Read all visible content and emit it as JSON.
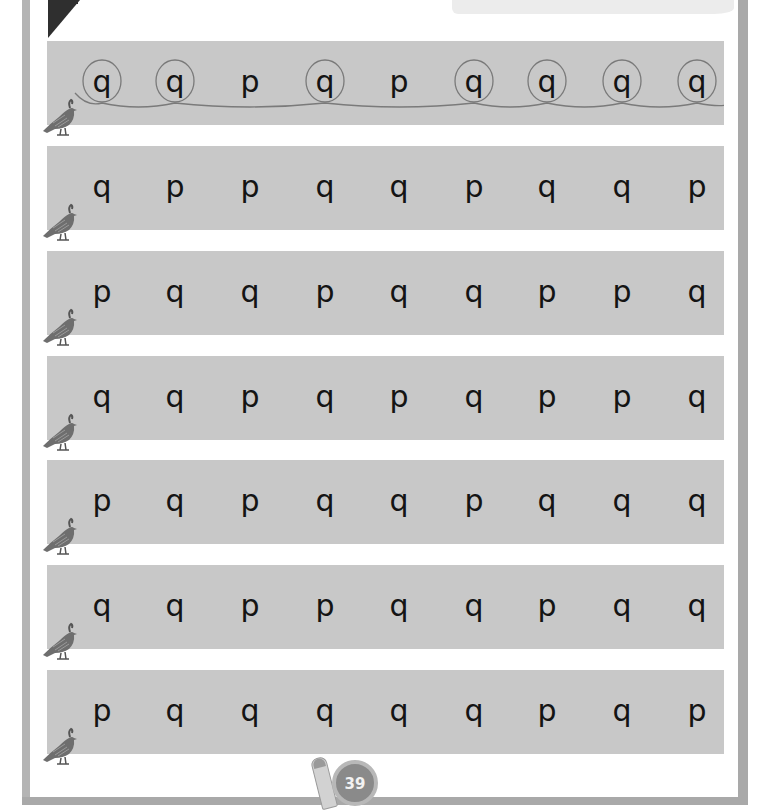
{
  "worksheet": {
    "instruction_example_row": 0,
    "letters_pair": [
      "p",
      "q"
    ],
    "target_letter": "q",
    "rows": [
      {
        "letters": [
          "q",
          "q",
          "p",
          "q",
          "p",
          "q",
          "q",
          "q",
          "q"
        ],
        "circled": [
          true,
          true,
          false,
          true,
          false,
          true,
          true,
          true,
          true
        ]
      },
      {
        "letters": [
          "q",
          "p",
          "p",
          "q",
          "q",
          "p",
          "q",
          "q",
          "p"
        ],
        "circled": [
          false,
          false,
          false,
          false,
          false,
          false,
          false,
          false,
          false
        ]
      },
      {
        "letters": [
          "p",
          "q",
          "q",
          "p",
          "q",
          "q",
          "p",
          "p",
          "q"
        ],
        "circled": [
          false,
          false,
          false,
          false,
          false,
          false,
          false,
          false,
          false
        ]
      },
      {
        "letters": [
          "q",
          "q",
          "p",
          "q",
          "p",
          "q",
          "p",
          "p",
          "q"
        ],
        "circled": [
          false,
          false,
          false,
          false,
          false,
          false,
          false,
          false,
          false
        ]
      },
      {
        "letters": [
          "p",
          "q",
          "p",
          "q",
          "q",
          "p",
          "q",
          "q",
          "q"
        ],
        "circled": [
          false,
          false,
          false,
          false,
          false,
          false,
          false,
          false,
          false
        ]
      },
      {
        "letters": [
          "q",
          "q",
          "p",
          "p",
          "q",
          "q",
          "p",
          "q",
          "q"
        ],
        "circled": [
          false,
          false,
          false,
          false,
          false,
          false,
          false,
          false,
          false
        ]
      },
      {
        "letters": [
          "p",
          "q",
          "q",
          "q",
          "q",
          "q",
          "p",
          "q",
          "p"
        ],
        "circled": [
          false,
          false,
          false,
          false,
          false,
          false,
          false,
          false,
          false
        ]
      }
    ],
    "row_icon": "quail-icon"
  },
  "footer": {
    "page_number": "39",
    "mascot_icon": "pencil-mascot-icon"
  },
  "colors": {
    "row_background": "#c8c8c8",
    "frame": "#a9a9a9",
    "letter": "#141414",
    "circle_stroke": "#7a7a7a",
    "page_badge": "#8a8a8a"
  }
}
